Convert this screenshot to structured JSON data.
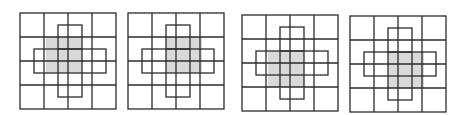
{
  "figure": {
    "colors": {
      "line": "#2b2b2b",
      "shade": "#d9d9d9",
      "background": "#ffffff"
    },
    "grid": {
      "rows": 4,
      "cols": 4,
      "size": 96
    },
    "cross": {
      "vertical_bar": {
        "x": 38,
        "y": 12,
        "w": 24,
        "h": 72
      },
      "horizontal_bar": {
        "x": 14,
        "y": 36,
        "w": 72,
        "h": 24
      }
    },
    "panels": [
      {
        "id": "panel-1",
        "left": 19,
        "top": 12,
        "shade": {
          "x": 26,
          "y": 24,
          "w": 36,
          "h": 36
        }
      },
      {
        "id": "panel-2",
        "left": 127,
        "top": 12,
        "shade": {
          "x": 38,
          "y": 24,
          "w": 36,
          "h": 36
        }
      },
      {
        "id": "panel-3",
        "left": 241,
        "top": 14,
        "shade": {
          "x": 26,
          "y": 36,
          "w": 36,
          "h": 36
        }
      },
      {
        "id": "panel-4",
        "left": 349,
        "top": 15,
        "shade": {
          "x": 38,
          "y": 36,
          "w": 36,
          "h": 36
        }
      }
    ]
  }
}
